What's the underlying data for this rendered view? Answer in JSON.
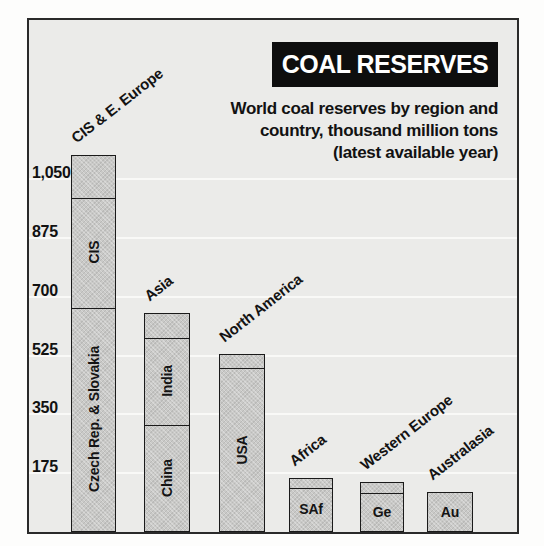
{
  "header": {
    "title": "COAL RESERVES",
    "subtitle_lines": [
      "World coal reserves by region and",
      "country, thousand million tons",
      "(latest available year)"
    ]
  },
  "colors": {
    "page_background": "#ffffff",
    "plot_background": "#ebebe9",
    "gridline": "#f9f9f7",
    "bar_fill": "#c9c9c7",
    "bar_border": "#1a1a1a",
    "title_box_background": "#0e0e0e",
    "title_text": "#ffffff",
    "label_text": "#141414"
  },
  "chart_data": {
    "type": "bar",
    "stacked": true,
    "title": "COAL RESERVES",
    "subtitle": "World coal reserves by region and country, thousand million tons (latest available year)",
    "unit": "thousand million tons",
    "ylim": [
      0,
      1160
    ],
    "grid": true,
    "yticks": [
      {
        "value": 175,
        "label": "175"
      },
      {
        "value": 350,
        "label": "350"
      },
      {
        "value": 525,
        "label": "525"
      },
      {
        "value": 700,
        "label": "700"
      },
      {
        "value": 875,
        "label": "875"
      },
      {
        "value": 1050,
        "label": "1,050"
      }
    ],
    "bars": [
      {
        "region": "CIS & E. Europe",
        "total": 1120,
        "segments": [
          {
            "label": "Czech Rep. & Slovakia",
            "value": 670,
            "orientation": "vertical"
          },
          {
            "label": "CIS",
            "value": 325,
            "orientation": "vertical"
          },
          {
            "label": "",
            "value": 125,
            "orientation": "vertical"
          }
        ]
      },
      {
        "region": "Asia",
        "total": 650,
        "segments": [
          {
            "label": "China",
            "value": 320,
            "orientation": "vertical"
          },
          {
            "label": "India",
            "value": 260,
            "orientation": "vertical"
          },
          {
            "label": "",
            "value": 70,
            "orientation": "vertical"
          }
        ]
      },
      {
        "region": "North America",
        "total": 530,
        "segments": [
          {
            "label": "USA",
            "value": 490,
            "orientation": "vertical"
          },
          {
            "label": "",
            "value": 40,
            "orientation": "vertical"
          }
        ]
      },
      {
        "region": "Africa",
        "total": 160,
        "segments": [
          {
            "label": "SAf",
            "value": 135,
            "orientation": "horizontal"
          },
          {
            "label": "",
            "value": 25,
            "orientation": "horizontal"
          }
        ]
      },
      {
        "region": "Western Europe",
        "total": 150,
        "segments": [
          {
            "label": "Ge",
            "value": 120,
            "orientation": "horizontal"
          },
          {
            "label": "",
            "value": 30,
            "orientation": "horizontal"
          }
        ]
      },
      {
        "region": "Australasia",
        "total": 120,
        "segments": [
          {
            "label": "Au",
            "value": 120,
            "orientation": "horizontal"
          }
        ]
      }
    ]
  }
}
